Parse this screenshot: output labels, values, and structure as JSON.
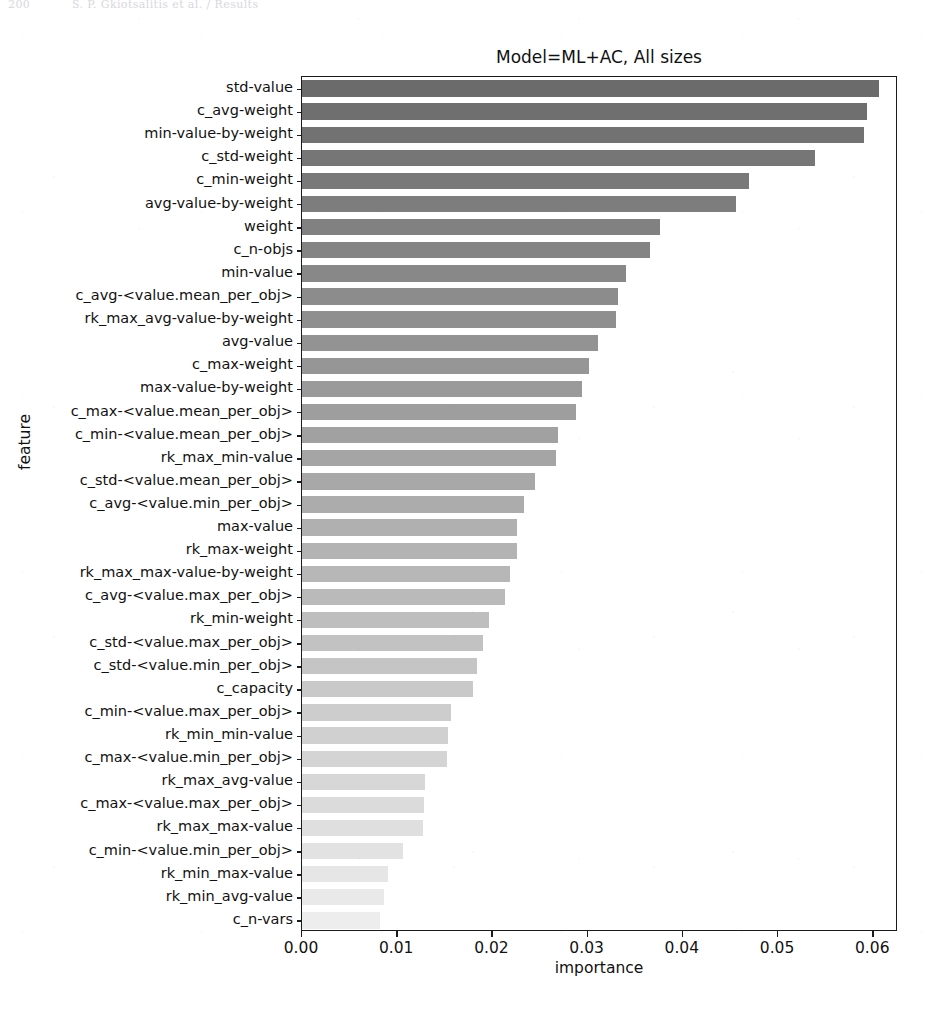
{
  "page_header": {
    "page_number": "200",
    "running_title": "S. P. Gkiotsalitis et al. / Results"
  },
  "chart_data": {
    "type": "bar",
    "orientation": "horizontal",
    "title": "Model=ML+AC, All sizes",
    "xlabel": "importance",
    "ylabel": "feature",
    "xlim": [
      0.0,
      0.0626
    ],
    "xticks": [
      0.0,
      0.01,
      0.02,
      0.03,
      0.04,
      0.05,
      0.06
    ],
    "xtick_labels": [
      "0.00",
      "0.01",
      "0.02",
      "0.03",
      "0.04",
      "0.05",
      "0.06"
    ],
    "grid": false,
    "legend": false,
    "bar_color_start": "#6b6b6b",
    "bar_color_end": "#ededed",
    "categories": [
      "std-value",
      "c_avg-weight",
      "min-value-by-weight",
      "c_std-weight",
      "c_min-weight",
      "avg-value-by-weight",
      "weight",
      "c_n-objs",
      "min-value",
      "c_avg-<value.mean_per_obj>",
      "rk_max_avg-value-by-weight",
      "avg-value",
      "c_max-weight",
      "max-value-by-weight",
      "c_max-<value.mean_per_obj>",
      "c_min-<value.mean_per_obj>",
      "rk_max_min-value",
      "c_std-<value.mean_per_obj>",
      "c_avg-<value.min_per_obj>",
      "max-value",
      "rk_max-weight",
      "rk_max_max-value-by-weight",
      "c_avg-<value.max_per_obj>",
      "rk_min-weight",
      "c_std-<value.max_per_obj>",
      "c_std-<value.min_per_obj>",
      "c_capacity",
      "c_min-<value.max_per_obj>",
      "rk_min_min-value",
      "c_max-<value.min_per_obj>",
      "rk_max_avg-value",
      "c_max-<value.max_per_obj>",
      "rk_max_max-value",
      "c_min-<value.min_per_obj>",
      "rk_min_max-value",
      "rk_min_avg-value",
      "c_n-vars"
    ],
    "values": [
      0.0606,
      0.0593,
      0.059,
      0.0539,
      0.047,
      0.0456,
      0.0376,
      0.0365,
      0.034,
      0.0332,
      0.033,
      0.0311,
      0.0301,
      0.0294,
      0.0288,
      0.0269,
      0.0267,
      0.0245,
      0.0233,
      0.0226,
      0.0226,
      0.0218,
      0.0213,
      0.0196,
      0.019,
      0.0184,
      0.018,
      0.0156,
      0.0153,
      0.0152,
      0.0129,
      0.0128,
      0.0127,
      0.0106,
      0.009,
      0.0086,
      0.0082
    ]
  }
}
